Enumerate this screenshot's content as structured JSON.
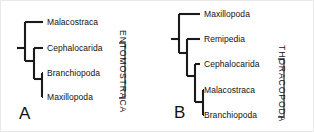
{
  "figure": {
    "width": 314,
    "height": 132,
    "background": "#ffffff",
    "line_color": "#1a1a1a",
    "text_color": "#111111"
  },
  "panels": [
    {
      "id": "A",
      "letter": "A",
      "letter_x": 18,
      "letter_y": 104,
      "clade_bracket": {
        "label": "ENTOMOSTRACA",
        "x": 126,
        "y": 29,
        "top": 42,
        "bottom": 97,
        "tip_x": 118,
        "spine_x": 124
      },
      "taxa": [
        {
          "name": "Malacostraca",
          "y": 21,
          "tip_x": 42,
          "label_x": 46
        },
        {
          "name": "Cephalocarida",
          "y": 47,
          "tip_x": 42,
          "label_x": 46
        },
        {
          "name": "Branchiopoda",
          "y": 72,
          "tip_x": 42,
          "label_x": 46
        },
        {
          "name": "Maxillopoda",
          "y": 96,
          "tip_x": 42,
          "label_x": 46
        }
      ],
      "branches": [
        "M 16 47 L 24 47",
        "M 24 21 L 24 60",
        "M 24 21 L 42 21",
        "M 24 60 L 33 60",
        "M 33 47 L 33 78",
        "M 33 47 L 42 47",
        "M 33 78 L 41 78",
        "M 41 72 L 41 96",
        "M 41 72 L 42 72",
        "M 41 96 L 42 96"
      ]
    },
    {
      "id": "B",
      "letter": "B",
      "letter_x": 16,
      "letter_y": 103,
      "clade_bracket": {
        "label": "THORACOPODA",
        "x": 128,
        "y": 44,
        "top": 58,
        "bottom": 116,
        "tip_x": 120,
        "spine_x": 126
      },
      "taxa": [
        {
          "name": "Maxillopoda",
          "y": 13,
          "tip_x": 42,
          "label_x": 46
        },
        {
          "name": "Remipedia",
          "y": 38,
          "tip_x": 42,
          "label_x": 46
        },
        {
          "name": "Cephalocarida",
          "y": 63,
          "tip_x": 42,
          "label_x": 46
        },
        {
          "name": "Malacostraca",
          "y": 89,
          "tip_x": 42,
          "label_x": 46
        },
        {
          "name": "Branchiopoda",
          "y": 114,
          "tip_x": 42,
          "label_x": 46
        }
      ],
      "branches": [
        "M 13 38 L 21 38",
        "M 21 13 L 21 52",
        "M 21 13 L 42 13",
        "M 21 52 L 29 52",
        "M 29 38 L 29 75",
        "M 29 38 L 42 38",
        "M 29 75 L 37 75",
        "M 37 63 L 37 101",
        "M 37 63 L 42 63",
        "M 37 101 L 45 101",
        "M 45 89 L 45 114",
        "M 45 89 L 46 89",
        "M 45 114 L 46 114"
      ]
    }
  ]
}
